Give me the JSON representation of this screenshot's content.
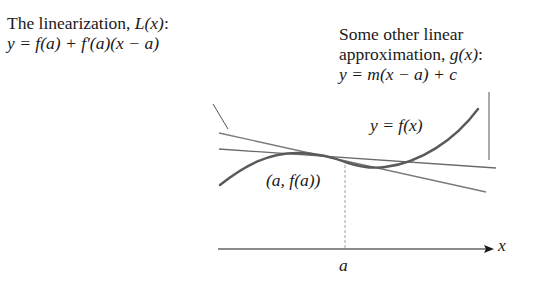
{
  "left_caption": {
    "title_prefix": "The linearization, ",
    "title_func": "L(x)",
    "title_suffix": ":",
    "equation": "y = f(a) + f′(a)(x − a)"
  },
  "right_caption": {
    "line1": "Some other linear",
    "line2_prefix": "approximation, ",
    "line2_func": "g(x)",
    "line2_suffix": ":",
    "equation": "y = m(x − a) + c"
  },
  "curve_label": "y = f(x)",
  "point_label": "(a, f(a))",
  "axis": {
    "x_label": "x",
    "tick_label": "a"
  },
  "colors": {
    "curve": "#5a5a5a",
    "lines": "#7a7a7a",
    "axis": "#1a1a1a",
    "dashed": "#9a9a9a",
    "text": "#1a1a1a"
  }
}
